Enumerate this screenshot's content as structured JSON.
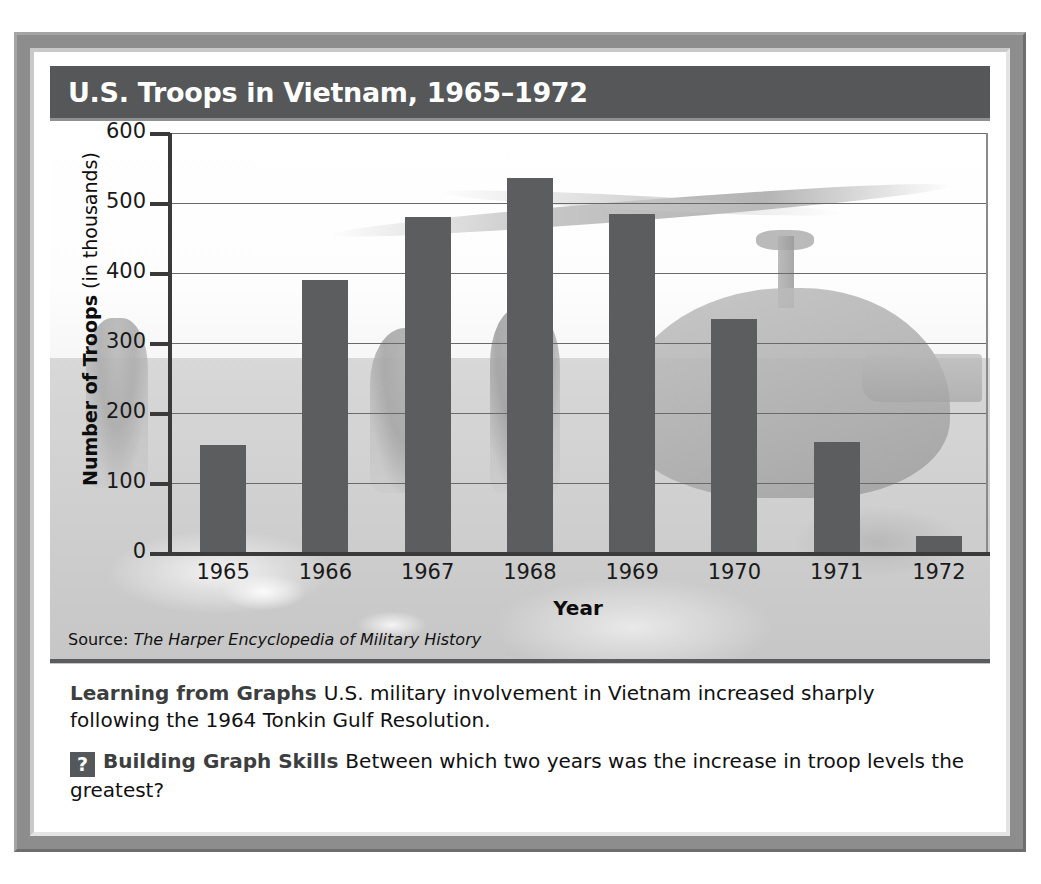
{
  "figure": {
    "title": "U.S. Troops in Vietnam, 1965–1972",
    "source_label": "Source:",
    "source_title": "The Harper Encyclopedia of Military History"
  },
  "caption": {
    "learning_lead": "Learning from Graphs",
    "learning_text": "U.S. military involvement in Vietnam increased sharply following the 1964 Tonkin Gulf Resolution.",
    "badge": "?",
    "skills_lead": "Building Graph Skills",
    "skills_text": "Between which two years was the increase in troop levels the greatest?"
  },
  "chart_data": {
    "type": "bar",
    "title": "U.S. Troops in Vietnam, 1965–1972",
    "categories": [
      "1965",
      "1966",
      "1967",
      "1968",
      "1969",
      "1970",
      "1971",
      "1972"
    ],
    "values": [
      155,
      390,
      480,
      536,
      484,
      335,
      158,
      24
    ],
    "xlabel": "Year",
    "ylabel_bold": "Number of Troops",
    "ylabel_normal": "(in thousands)",
    "ylabel": "Number of Troops (in thousands)",
    "ylim": [
      0,
      600
    ],
    "ytick_labels": [
      "600",
      "500",
      "400",
      "300",
      "200",
      "100",
      "0"
    ],
    "ytick_values": [
      600,
      500,
      400,
      300,
      200,
      100,
      0
    ],
    "grid": true,
    "legend": "none",
    "bar_color": "#5b5d5f",
    "units": "thousands of troops"
  },
  "colors": {
    "frame": "#8d8d8d",
    "title_band": "#555759",
    "bar": "#5b5d5f",
    "gridline": "#6a6a6a",
    "axis": "#3a3a3a",
    "caption_lead": "#3c3e40"
  }
}
